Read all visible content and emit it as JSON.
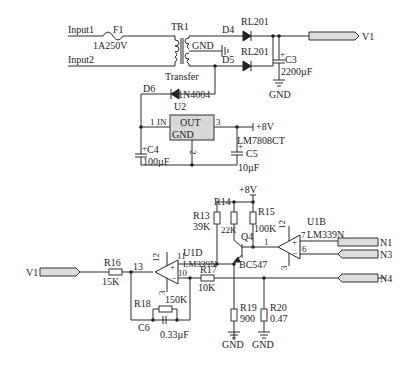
{
  "diagram": {
    "type": "circuit-schematic",
    "power_supply": {
      "inputs": [
        "Input1",
        "Input2"
      ],
      "fuse": {
        "ref": "F1",
        "value": "1A250V"
      },
      "transformer": {
        "ref": "TR1",
        "label": "Transfer",
        "tap": "GND"
      },
      "diodes": [
        {
          "ref": "D4",
          "part": "RL201"
        },
        {
          "ref": "D5",
          "part": "RL201"
        },
        {
          "ref": "D6",
          "part": "1N4004"
        }
      ],
      "c3": {
        "ref": "C3",
        "value": "2200µF"
      },
      "gnd1": "GND",
      "output_port": "V1",
      "regulator": {
        "ref": "U2",
        "part": "LM7808CT",
        "pin_in": "1",
        "pin_in_label": "IN",
        "pin_out_label": "OUT",
        "pin_out": "3",
        "pin_gnd_label": "GND",
        "pin_gnd": "2"
      },
      "c4": {
        "ref": "C4",
        "value": "100µF"
      },
      "c5": {
        "ref": "C5",
        "value": "10µF"
      },
      "vplus": "+8V"
    },
    "comparator": {
      "input_port": "V1",
      "r16": {
        "ref": "R16",
        "value": "15K"
      },
      "node13": "13",
      "u1d": {
        "ref": "U1D",
        "part": "LM339N",
        "pin_top": "12",
        "pin_out": "11",
        "pin_neg": "10",
        "pin_gnd": "3"
      },
      "r17": {
        "ref": "R17",
        "value": "10K"
      },
      "r18": {
        "ref": "R18",
        "value": "150K"
      },
      "c6": {
        "ref": "C6",
        "value": "0.33µF"
      },
      "vplus": "+8V",
      "r13": {
        "ref": "R13",
        "value": "39K"
      },
      "r14": {
        "ref": "R14",
        "value": "22K"
      },
      "r15": {
        "ref": "R15",
        "value": "100K"
      },
      "q4": {
        "ref": "Q4",
        "part": "BC547"
      },
      "u1b": {
        "ref": "U1B",
        "part": "LM339N",
        "pin_out": "1",
        "pin_top": "12",
        "pin_pos": "7",
        "pin_neg": "6",
        "pin_gnd": "3"
      },
      "r19": {
        "ref": "R19",
        "value": "900"
      },
      "r20": {
        "ref": "R20",
        "value": "0.47"
      },
      "gnd_a": "GND",
      "gnd_b": "GND",
      "ports": [
        "N1",
        "N3",
        "N4"
      ]
    }
  }
}
